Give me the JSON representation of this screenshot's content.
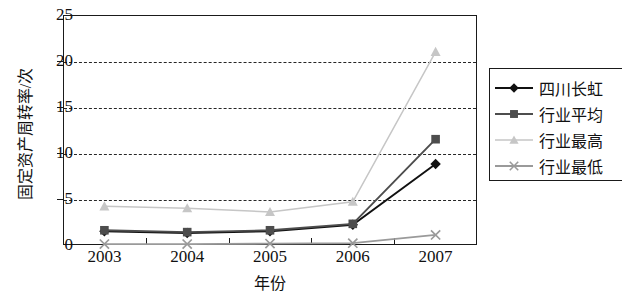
{
  "chart_data": {
    "type": "line",
    "title": "",
    "xlabel": "年份",
    "ylabel": "固定资产周转率/次",
    "categories": [
      "2003",
      "2004",
      "2005",
      "2006",
      "2007"
    ],
    "ylim": [
      0,
      25
    ],
    "yticks": [
      0,
      5,
      10,
      15,
      20,
      25
    ],
    "grid": "horizontal-dashed",
    "legend_position": "right",
    "series": [
      {
        "name": "四川长虹",
        "marker": "diamond",
        "color": "#111111",
        "values": [
          1.5,
          1.3,
          1.5,
          2.2,
          8.8
        ]
      },
      {
        "name": "行业平均",
        "marker": "square",
        "color": "#4d4d4d",
        "values": [
          1.6,
          1.4,
          1.6,
          2.3,
          11.5
        ]
      },
      {
        "name": "行业最高",
        "marker": "triangle",
        "color": "#c6c6c6",
        "values": [
          4.2,
          4.0,
          3.6,
          4.7,
          21.0
        ]
      },
      {
        "name": "行业最低",
        "marker": "x",
        "color": "#9a9a9a",
        "values": [
          0.1,
          0.1,
          0.15,
          0.2,
          1.1
        ]
      }
    ]
  }
}
